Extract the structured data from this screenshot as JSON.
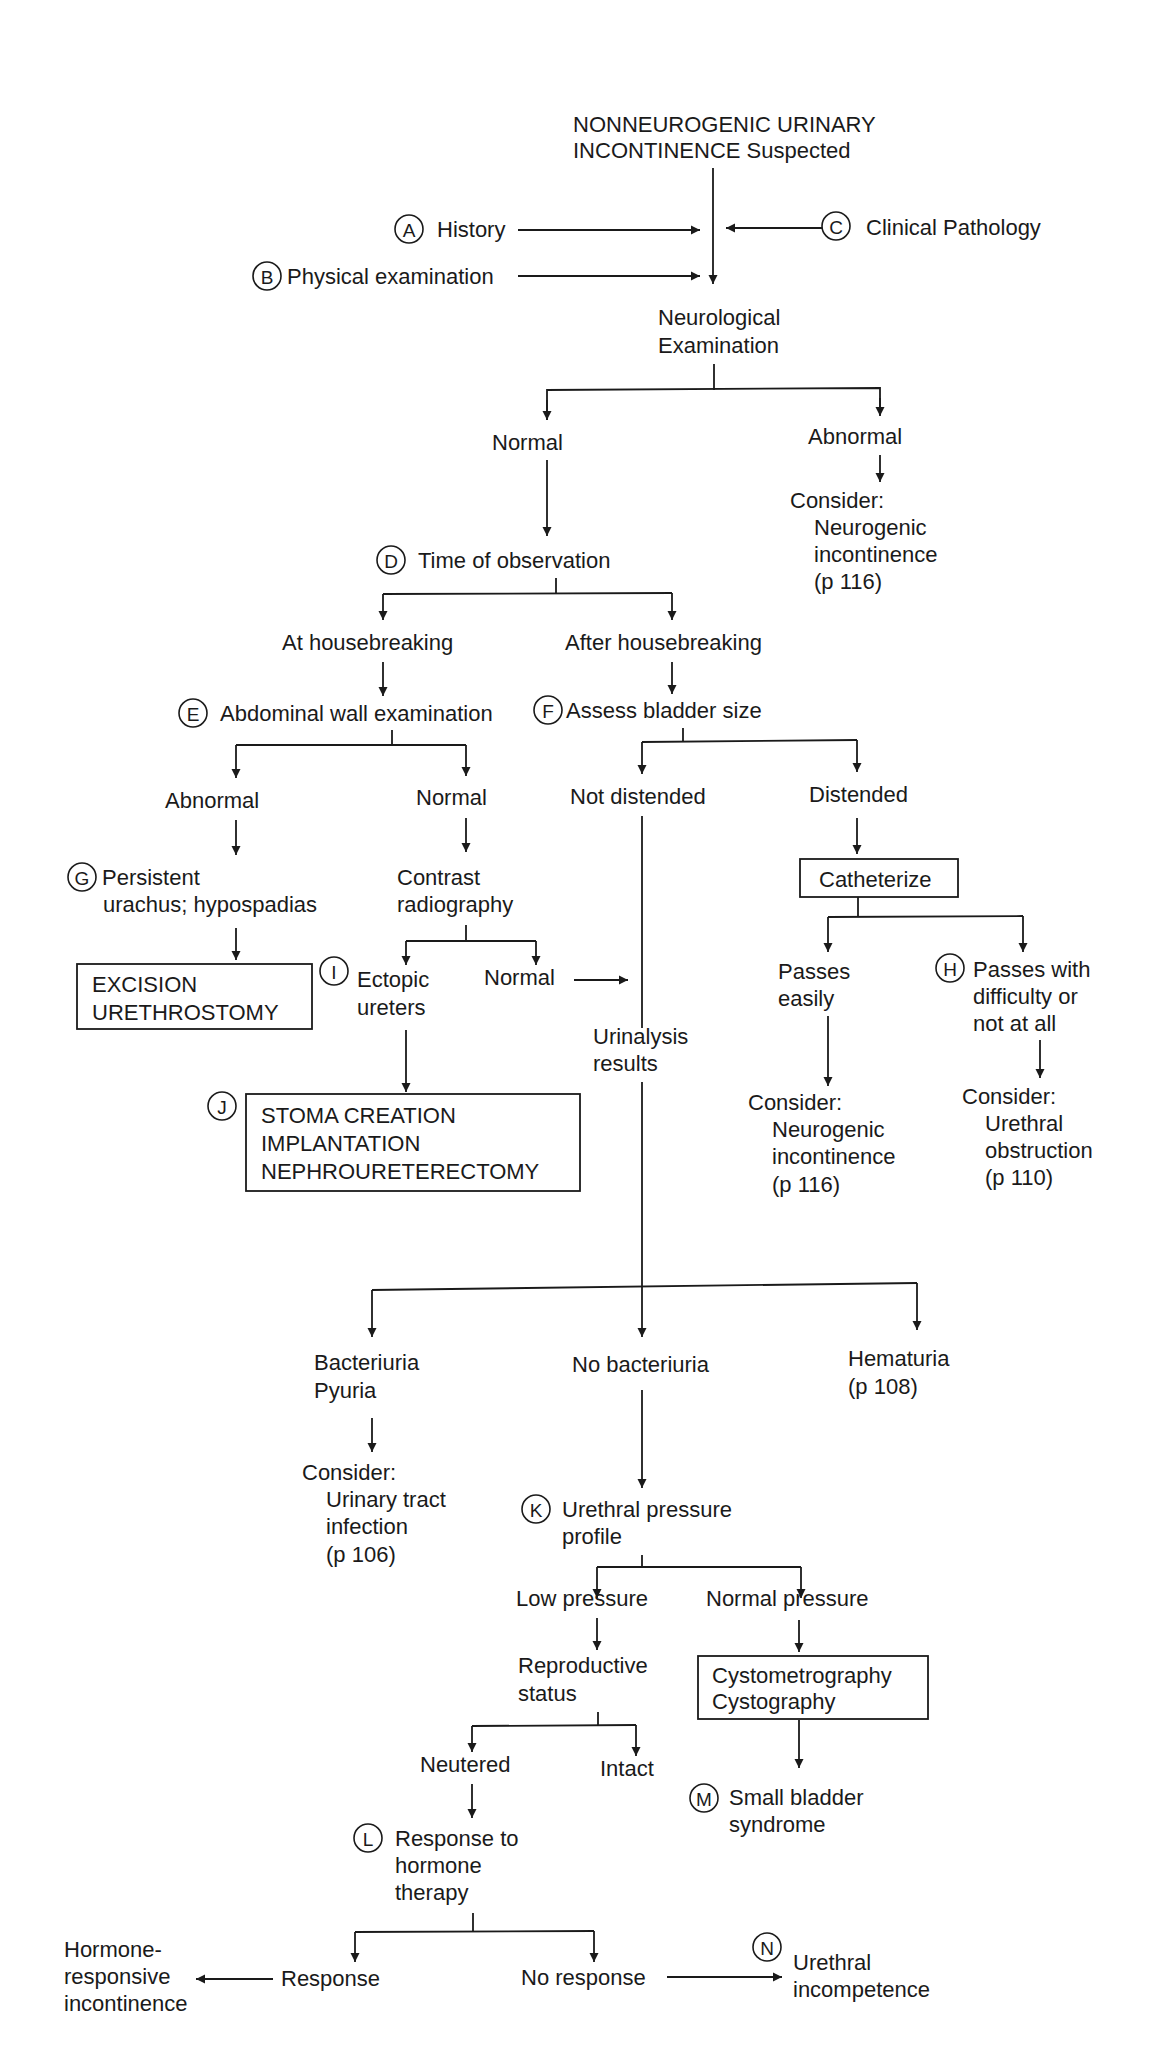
{
  "title": [
    "NONNEUROGENIC URINARY",
    "INCONTINENCE Suspected"
  ],
  "inputs": {
    "history": {
      "badge": "A",
      "label": "History"
    },
    "physical": {
      "badge": "B",
      "label": "Physical examination"
    },
    "clinpath": {
      "badge": "C",
      "label": "Clinical Pathology"
    }
  },
  "neuro": [
    "Neurological",
    "Examination"
  ],
  "neuro_normal": "Normal",
  "neuro_abnormal": "Abnormal",
  "neuro_consider": [
    "Consider:",
    "Neurogenic",
    "incontinence",
    "(p 116)"
  ],
  "time": {
    "badge": "D",
    "label": "Time of observation"
  },
  "at_house": "At housebreaking",
  "after_house": "After housebreaking",
  "abdominal": {
    "badge": "E",
    "label": "Abdominal wall examination"
  },
  "bladder": {
    "badge": "F",
    "label": "Assess bladder size"
  },
  "abd_abnormal": "Abnormal",
  "abd_normal": "Normal",
  "not_distended": "Not distended",
  "distended": "Distended",
  "persistent": {
    "badge": "G",
    "lines": [
      "Persistent",
      "urachus; hypospadias"
    ]
  },
  "contrast": [
    "Contrast",
    "radiography"
  ],
  "catheterize": "Catheterize",
  "excision_box": [
    "EXCISION",
    "URETHROSTOMY"
  ],
  "ectopic": {
    "badge": "I",
    "lines": [
      "Ectopic",
      "ureters"
    ]
  },
  "contrast_normal": "Normal",
  "passes_easily": [
    "Passes",
    "easily"
  ],
  "passes_difficulty": {
    "badge": "H",
    "lines": [
      "Passes with",
      "difficulty or",
      "not at all"
    ]
  },
  "urinalysis": [
    "Urinalysis",
    "results"
  ],
  "stoma_box": {
    "badge": "J",
    "lines": [
      "STOMA CREATION",
      "IMPLANTATION",
      "NEPHROURETERECTOMY"
    ]
  },
  "cath_easy_consider": [
    "Consider:",
    "Neurogenic",
    "incontinence",
    "(p 116)"
  ],
  "cath_hard_consider": [
    "Consider:",
    "Urethral",
    "obstruction",
    "(p 110)"
  ],
  "bacteriuria": [
    "Bacteriuria",
    "Pyuria"
  ],
  "no_bacteriuria": "No bacteriuria",
  "hematuria": [
    "Hematuria",
    "(p 108)"
  ],
  "uti_consider": [
    "Consider:",
    "Urinary tract",
    "infection",
    "(p 106)"
  ],
  "pressure": {
    "badge": "K",
    "lines": [
      "Urethral pressure",
      "profile"
    ]
  },
  "low_pressure": "Low pressure",
  "normal_pressure": "Normal pressure",
  "repro": [
    "Reproductive",
    "status"
  ],
  "cysto_box": [
    "Cystometrography",
    "Cystography"
  ],
  "neutered": "Neutered",
  "intact": "Intact",
  "small_bladder": {
    "badge": "M",
    "lines": [
      "Small bladder",
      "syndrome"
    ]
  },
  "hormone": {
    "badge": "L",
    "lines": [
      "Response to",
      "hormone",
      "therapy"
    ]
  },
  "hormone_responsive": [
    "Hormone-",
    "responsive",
    "incontinence"
  ],
  "response": "Response",
  "no_response": "No response",
  "incompetence": {
    "badge": "N",
    "lines": [
      "Urethral",
      "incompetence"
    ]
  }
}
